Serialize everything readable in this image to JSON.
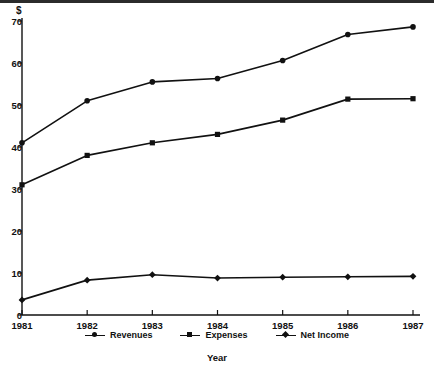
{
  "chart_data": {
    "type": "line",
    "title": "",
    "xlabel": "Year",
    "ylabel": "$",
    "categories": [
      "1981",
      "1982",
      "1983",
      "1984",
      "1985",
      "1986",
      "1987"
    ],
    "x": [
      1981,
      1982,
      1983,
      1984,
      1985,
      1986,
      1987
    ],
    "xlim": [
      1981,
      1987
    ],
    "ylim": [
      0,
      70
    ],
    "yticks": [
      0,
      10,
      20,
      30,
      40,
      50,
      60,
      70
    ],
    "ytick_labels": [
      "0",
      "10",
      "20",
      "30",
      "40",
      "50",
      "60",
      "70"
    ],
    "grid": false,
    "legend_position": "bottom",
    "series": [
      {
        "name": "Revenues",
        "marker": "dot",
        "color": "#111111",
        "values": [
          41.0,
          51.0,
          55.5,
          56.3,
          60.6,
          66.8,
          68.6
        ]
      },
      {
        "name": "Expenses",
        "marker": "square",
        "color": "#111111",
        "values": [
          31.0,
          38.0,
          41.0,
          43.0,
          46.4,
          51.4,
          51.5
        ]
      },
      {
        "name": "Net Income",
        "marker": "diamond",
        "color": "#111111",
        "values": [
          3.6,
          8.3,
          9.6,
          8.8,
          9.0,
          9.1,
          9.2
        ]
      }
    ]
  },
  "axes": {
    "y_title": "$",
    "x_title": "Year"
  },
  "legend": {
    "items": [
      {
        "label": "Revenues",
        "marker": "dot"
      },
      {
        "label": "Expenses",
        "marker": "square"
      },
      {
        "label": "Net Income",
        "marker": "diamond"
      }
    ]
  }
}
